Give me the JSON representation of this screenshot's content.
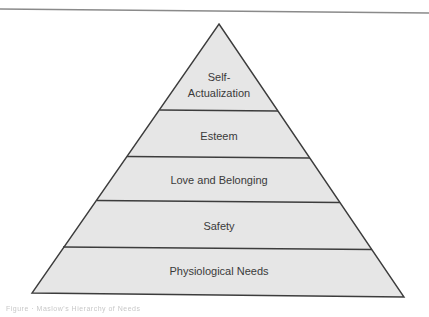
{
  "diagram": {
    "type": "pyramid",
    "title": "",
    "levels_top_to_bottom": [
      {
        "id": "self-actualization",
        "lines": [
          "Self-",
          "Actualization"
        ]
      },
      {
        "id": "esteem",
        "lines": [
          "Esteem"
        ]
      },
      {
        "id": "love-and-belonging",
        "lines": [
          "Love and Belonging"
        ]
      },
      {
        "id": "safety",
        "lines": [
          "Safety"
        ]
      },
      {
        "id": "physiological-needs",
        "lines": [
          "Physiological Needs"
        ]
      }
    ],
    "colors": {
      "fill": "#e6e6e6",
      "stroke": "#3c3c3c",
      "text": "#3a3a3a",
      "top_rule": "#8a8a8a"
    }
  },
  "caption": {
    "text": "Figure  ·  Maslow's Hierarchy of Needs"
  }
}
